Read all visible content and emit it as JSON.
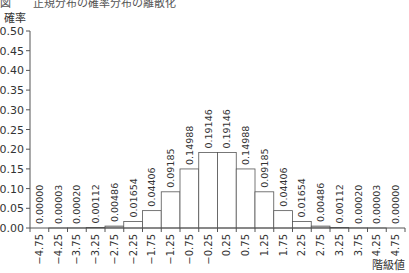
{
  "chart_data": {
    "type": "bar",
    "title": "",
    "xlabel": "階級値",
    "ylabel": "確率",
    "ylim": [
      0,
      0.5
    ],
    "yticks": [
      "0.00",
      "0.05",
      "0.10",
      "0.15",
      "0.20",
      "0.25",
      "0.30",
      "0.35",
      "0.40",
      "0.45",
      "0.50"
    ],
    "grid": false,
    "legend": null,
    "categories": [
      "−4.75",
      "−4.25",
      "−3.75",
      "−3.25",
      "−2.75",
      "−2.25",
      "−1.75",
      "−1.25",
      "−0.75",
      "−0.25",
      "0.25",
      "0.75",
      "1.25",
      "1.75",
      "2.25",
      "2.75",
      "3.25",
      "3.75",
      "4.25",
      "4.75"
    ],
    "values": [
      0.0,
      3e-05,
      0.0002,
      0.00112,
      0.00486,
      0.01654,
      0.04406,
      0.09185,
      0.14988,
      0.19146,
      0.19146,
      0.14988,
      0.09185,
      0.04406,
      0.01654,
      0.00486,
      0.00112,
      0.0002,
      3e-05,
      0.0
    ],
    "value_labels": [
      "0.00000",
      "0.00003",
      "0.00020",
      "0.00112",
      "0.00486",
      "0.01654",
      "0.04406",
      "0.09185",
      "0.14988",
      "0.19146",
      "0.19146",
      "0.14988",
      "0.09185",
      "0.04406",
      "0.01654",
      "0.00486",
      "0.00112",
      "0.00020",
      "0.00003",
      "0.00000"
    ],
    "bar_fill": "#ffffff",
    "bar_stroke": "#555555"
  },
  "header": {
    "truncated_caption": "図　　正規分布の確率分布の離散化"
  },
  "axes": {
    "y_title": "確率",
    "x_title": "階級値"
  }
}
